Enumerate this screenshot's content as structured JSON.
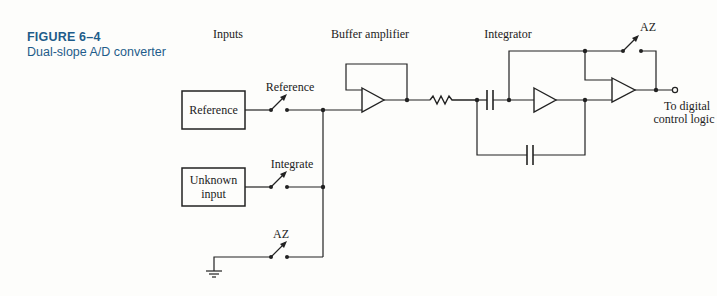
{
  "caption": {
    "figure_number": "FIGURE 6–4",
    "title": "Dual-slope A/D converter",
    "color": "#1e5c8a"
  },
  "sections": {
    "inputs": "Inputs",
    "buffer": "Buffer amplifier",
    "integrator": "Integrator"
  },
  "blocks": {
    "reference": "Reference",
    "unknown_line1": "Unknown",
    "unknown_line2": "input"
  },
  "switches": {
    "reference": "Reference",
    "integrate": "Integrate",
    "az_input": "AZ",
    "az_output": "AZ"
  },
  "output": {
    "line1": "To digital",
    "line2": "control logic"
  }
}
